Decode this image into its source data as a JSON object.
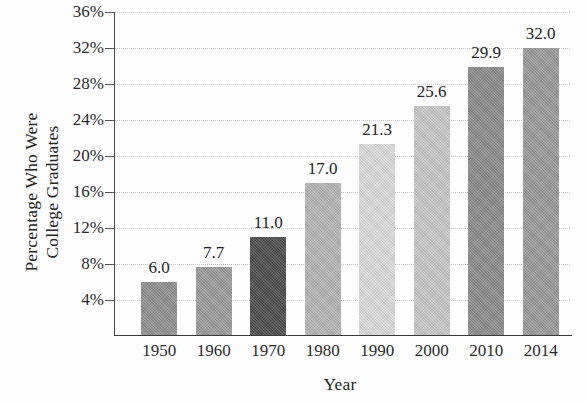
{
  "chart_data": {
    "type": "bar",
    "title": "",
    "subtitle": "",
    "xlabel": "Year",
    "ylabel": "Percentage Who Were College Graduates",
    "ylabel_lines": [
      "Percentage Who Were",
      "College Graduates"
    ],
    "categories": [
      "1950",
      "1960",
      "1970",
      "1980",
      "1990",
      "2000",
      "2010",
      "2014"
    ],
    "values": [
      6.0,
      7.7,
      11.0,
      17.0,
      21.3,
      25.6,
      29.9,
      32.0
    ],
    "data_labels": [
      "6.0",
      "7.7",
      "11.0",
      "17.0",
      "21.3",
      "25.6",
      "29.9",
      "32.0"
    ],
    "bar_colors": [
      "#8f8f8f",
      "#9a9a9a",
      "#4d4d4d",
      "#b4b4b4",
      "#d9d9d9",
      "#c6c6c6",
      "#8b8b8b",
      "#999999"
    ],
    "ylim": [
      0,
      36
    ],
    "ytick_values": [
      4,
      8,
      12,
      16,
      20,
      24,
      28,
      32,
      36
    ],
    "ytick_labels": [
      "4%",
      "8%",
      "12%",
      "16%",
      "20%",
      "24%",
      "28%",
      "32%",
      "36%"
    ],
    "grid": true,
    "grid_axis": "y",
    "legend": false,
    "legend_position": "none"
  },
  "style": {
    "background": "#fdfdfd",
    "grid_color": "#c9c9c9",
    "axis_color": "#4a4a4a",
    "text_color": "#2b2b2b"
  }
}
